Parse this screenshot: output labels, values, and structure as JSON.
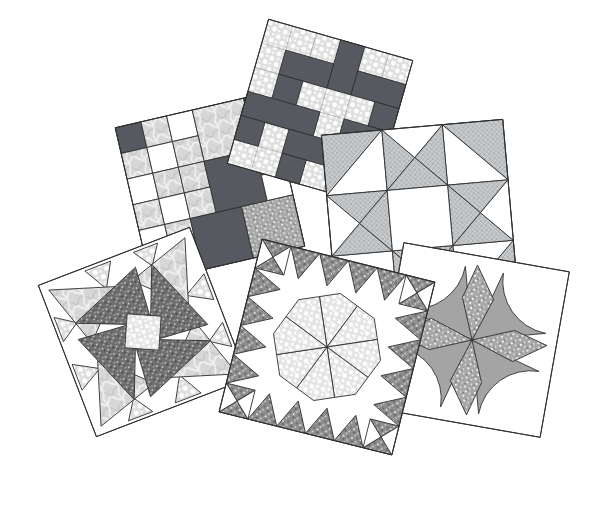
{
  "canvas": {
    "width": 597,
    "height": 511,
    "background": "#ffffff"
  },
  "illustration": {
    "name": "overlapping-quilt-blocks",
    "block_count": 6
  },
  "palette": {
    "outline": "#2f2f2f",
    "dark_solid": "#565a60",
    "fin_gray": "#a4a4a4",
    "white": "#ffffff",
    "polka_bg": "#dedede",
    "pebble_bg": "#e3e3e3",
    "crosshatch_bg": "#c9ccce",
    "crosshatch_line": "#a8acae",
    "dark_speckle": "#6f6f6f",
    "mid_speckle": "#a8a8a8",
    "border_speckle": "#8e8e8e",
    "marble_bg": "#d7d7d7"
  },
  "blocks": [
    {
      "id": "patchwork-squares-block",
      "fabrics": [
        "dark-solid",
        "marble",
        "white",
        "polka-dot",
        "speckle"
      ]
    },
    {
      "id": "interlocked-chain-block",
      "fabrics": [
        "dark-solid",
        "polka-dot"
      ]
    },
    {
      "id": "ohio-star-block",
      "fabrics": [
        "crosshatch",
        "white"
      ]
    },
    {
      "id": "whirligig-star-block",
      "fabrics": [
        "dark-speckle",
        "marble",
        "polka-dot",
        "pebble",
        "white"
      ]
    },
    {
      "id": "lemoyne-star-block",
      "fabrics": [
        "pebble",
        "dark-speckle",
        "white"
      ]
    },
    {
      "id": "curved-windmill-block",
      "fabrics": [
        "fin-gray",
        "mid-speckle",
        "white"
      ]
    }
  ]
}
